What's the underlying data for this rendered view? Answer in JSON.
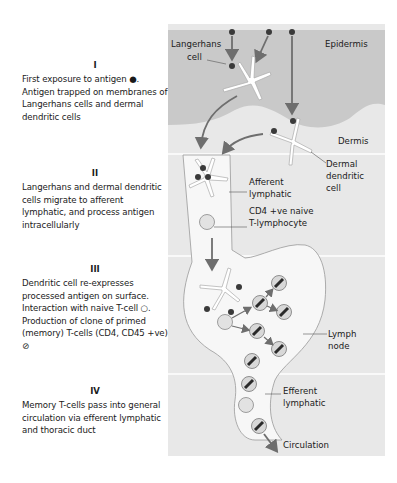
{
  "stages": [
    {
      "numeral": "I",
      "text": "First exposure to antigen ●. Antigen trapped on membranes of Langerhans cells and dermal dendritic cells"
    },
    {
      "numeral": "II",
      "text": "Langerhans and dermal dendritic cells migrate to afferent lymphatic, and process antigen intracellularly"
    },
    {
      "numeral": "III",
      "text": "Dendritic cell re-expresses processed antigen on surface. Interaction with naive T-cell ○. Production of clone of primed (memory) T-cells (CD4, CD45 +ve) ⊘"
    },
    {
      "numeral": "IV",
      "text": "Memory T-cells pass into general circulation via efferent lymphatic and thoracic duct"
    }
  ],
  "labels": {
    "langerhans_1": "Langerhans",
    "langerhans_2": "cell",
    "epidermis": "Epidermis",
    "dermis": "Dermis",
    "dermal_1": "Dermal",
    "dermal_2": "dendritic",
    "dermal_3": "cell",
    "afferent_1": "Afferent",
    "afferent_2": "lymphatic",
    "cd4_1": "CD4 +ve naive",
    "cd4_2": "T-lymphocyte",
    "lymph_1": "Lymph",
    "lymph_2": "node",
    "efferent_1": "Efferent",
    "efferent_2": "lymphatic",
    "circulation": "Circulation"
  },
  "colors": {
    "panel_bg": "#e8e8e8",
    "epidermis": "#c9c9c9",
    "arrow": "#6e6e6e",
    "antigen": "#3a3a3a",
    "cell_fill": "#d8d8d8"
  }
}
